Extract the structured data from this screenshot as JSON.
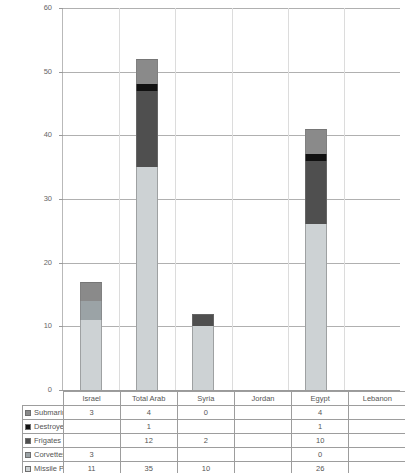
{
  "chart_data": {
    "type": "bar",
    "subtype": "stacked-vertical",
    "title": "",
    "xlabel": "",
    "ylabel": "",
    "ylim": [
      0,
      60
    ],
    "y_ticks": [
      0,
      10,
      20,
      30,
      40,
      50,
      60
    ],
    "grid": true,
    "legend_position": "row-header-table",
    "categories": [
      "Israel",
      "Total Arab",
      "Syria",
      "Jordan",
      "Egypt",
      "Lebanon"
    ],
    "stack_order_bottom_to_top": [
      "Missile Patrol",
      "Corvettes",
      "Frigates",
      "Destroyers",
      "Submarines"
    ],
    "series": [
      {
        "name": "Submarines",
        "color": "#8a8a8a",
        "values": [
          3,
          4,
          0,
          null,
          4,
          null
        ],
        "labels": [
          "3",
          "4",
          "0",
          "",
          "4",
          ""
        ]
      },
      {
        "name": "Destroyers",
        "color": "#111111",
        "values": [
          null,
          1,
          null,
          null,
          1,
          null
        ],
        "labels": [
          "",
          "1",
          "",
          "",
          "1",
          ""
        ]
      },
      {
        "name": "Frigates",
        "color": "#4f4f4f",
        "values": [
          null,
          12,
          2,
          null,
          10,
          null
        ],
        "labels": [
          "",
          "12",
          "2",
          "",
          "10",
          ""
        ]
      },
      {
        "name": "Corvettes",
        "color": "#9ba3a6",
        "values": [
          3,
          null,
          null,
          null,
          0,
          null
        ],
        "labels": [
          "3",
          "",
          "",
          "",
          "0",
          ""
        ]
      },
      {
        "name": "Missile Patrol",
        "color": "#cdd2d4",
        "values": [
          11,
          35,
          10,
          null,
          26,
          null
        ],
        "labels": [
          "11",
          "35",
          "10",
          "",
          "26",
          ""
        ]
      }
    ],
    "totals": [
      17,
      52,
      12,
      0,
      41,
      0
    ]
  },
  "table": {
    "column_headers": [
      "",
      "Israel",
      "Total Arab",
      "Syria",
      "Jordan",
      "Egypt",
      "Lebanon"
    ],
    "rows": [
      {
        "series": "Submarines",
        "swatch": "#8a8a8a",
        "cells": [
          "3",
          "4",
          "0",
          "",
          "4",
          ""
        ]
      },
      {
        "series": "Destroyers",
        "swatch": "#111111",
        "cells": [
          "",
          "1",
          "",
          "",
          "1",
          ""
        ]
      },
      {
        "series": "Frigates",
        "swatch": "#4f4f4f",
        "cells": [
          "",
          "12",
          "2",
          "",
          "10",
          ""
        ]
      },
      {
        "series": "Corvettes",
        "swatch": "#9ba3a6",
        "cells": [
          "3",
          "",
          "",
          "",
          "0",
          ""
        ]
      },
      {
        "series": "Missile Patrol",
        "swatch": "#cdd2d4",
        "cells": [
          "11",
          "35",
          "10",
          "",
          "26",
          ""
        ]
      }
    ]
  },
  "axis": {
    "y_tick_labels": [
      "60",
      "50",
      "40",
      "30",
      "20",
      "10",
      "0"
    ]
  },
  "colors": {
    "gridline": "#b0b0b0",
    "axis": "#9a9a9a",
    "table_border": "#9d9d9d",
    "text": "#555555",
    "background": "#ffffff"
  }
}
